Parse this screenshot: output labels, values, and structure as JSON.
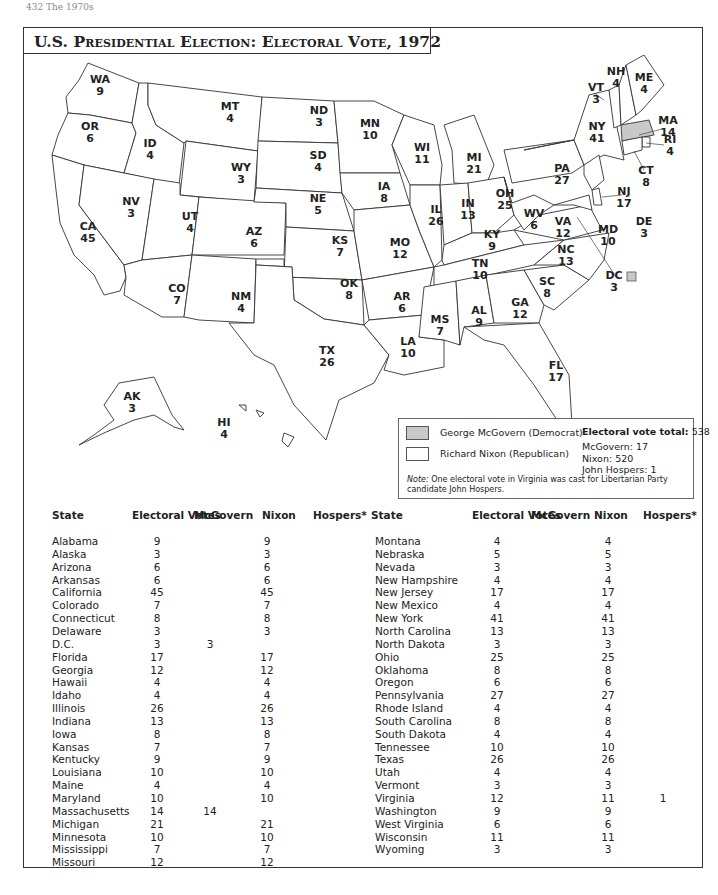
{
  "page_header": "432   The 1970s",
  "title": "U.S. Presidential Election: Electoral Vote, 1972",
  "legend": {
    "mcgovern_label": "George McGovern (Democrat)",
    "nixon_label": "Richard Nixon (Republican)",
    "mcgovern_color": "#c8c8c8",
    "nixon_color": "#ffffff",
    "total_label": "Electoral vote total:",
    "total_value": "538",
    "totals": [
      "McGovern: 17",
      "Nixon: 520",
      "John Hospers: 1"
    ],
    "note_label": "Note:",
    "note_text": " One electoral vote in Virginia was cast for Libertarian Party candidate John Hospers."
  },
  "map": {
    "labels": [
      {
        "abbr": "WA",
        "ev": "9"
      },
      {
        "abbr": "OR",
        "ev": "6"
      },
      {
        "abbr": "CA",
        "ev": "45"
      },
      {
        "abbr": "ID",
        "ev": "4"
      },
      {
        "abbr": "NV",
        "ev": "3"
      },
      {
        "abbr": "MT",
        "ev": "4"
      },
      {
        "abbr": "WY",
        "ev": "3"
      },
      {
        "abbr": "UT",
        "ev": "4"
      },
      {
        "abbr": "AZ",
        "ev": "6"
      },
      {
        "abbr": "CO",
        "ev": "7"
      },
      {
        "abbr": "NM",
        "ev": "4"
      },
      {
        "abbr": "ND",
        "ev": "3"
      },
      {
        "abbr": "SD",
        "ev": "4"
      },
      {
        "abbr": "NE",
        "ev": "5"
      },
      {
        "abbr": "KS",
        "ev": "7"
      },
      {
        "abbr": "OK",
        "ev": "8"
      },
      {
        "abbr": "TX",
        "ev": "26"
      },
      {
        "abbr": "MN",
        "ev": "10"
      },
      {
        "abbr": "IA",
        "ev": "8"
      },
      {
        "abbr": "MO",
        "ev": "12"
      },
      {
        "abbr": "AR",
        "ev": "6"
      },
      {
        "abbr": "LA",
        "ev": "10"
      },
      {
        "abbr": "WI",
        "ev": "11"
      },
      {
        "abbr": "IL",
        "ev": "26"
      },
      {
        "abbr": "MI",
        "ev": "21"
      },
      {
        "abbr": "IN",
        "ev": "13"
      },
      {
        "abbr": "OH",
        "ev": "25"
      },
      {
        "abbr": "KY",
        "ev": "9"
      },
      {
        "abbr": "TN",
        "ev": "10"
      },
      {
        "abbr": "MS",
        "ev": "7"
      },
      {
        "abbr": "AL",
        "ev": "9"
      },
      {
        "abbr": "GA",
        "ev": "12"
      },
      {
        "abbr": "FL",
        "ev": "17"
      },
      {
        "abbr": "SC",
        "ev": "8"
      },
      {
        "abbr": "NC",
        "ev": "13"
      },
      {
        "abbr": "VA",
        "ev": "12"
      },
      {
        "abbr": "WV",
        "ev": "6"
      },
      {
        "abbr": "PA",
        "ev": "27"
      },
      {
        "abbr": "NY",
        "ev": "41"
      },
      {
        "abbr": "VT",
        "ev": "3"
      },
      {
        "abbr": "NH",
        "ev": "4"
      },
      {
        "abbr": "ME",
        "ev": "4"
      },
      {
        "abbr": "MA",
        "ev": "14"
      },
      {
        "abbr": "RI",
        "ev": "4"
      },
      {
        "abbr": "CT",
        "ev": "8"
      },
      {
        "abbr": "NJ",
        "ev": "17"
      },
      {
        "abbr": "DE",
        "ev": "3"
      },
      {
        "abbr": "MD",
        "ev": "10"
      },
      {
        "abbr": "DC",
        "ev": "3"
      },
      {
        "abbr": "AK",
        "ev": "3"
      },
      {
        "abbr": "HI",
        "ev": "4"
      }
    ]
  },
  "table": {
    "headers": [
      "State",
      "Electoral Votes",
      "McGovern",
      "Nixon",
      "Hospers*"
    ],
    "left_rows": [
      [
        "Alabama",
        "9",
        "",
        "9",
        ""
      ],
      [
        "Alaska",
        "3",
        "",
        "3",
        ""
      ],
      [
        "Arizona",
        "6",
        "",
        "6",
        ""
      ],
      [
        "Arkansas",
        "6",
        "",
        "6",
        ""
      ],
      [
        "California",
        "45",
        "",
        "45",
        ""
      ],
      [
        "Colorado",
        "7",
        "",
        "7",
        ""
      ],
      [
        "Connecticut",
        "8",
        "",
        "8",
        ""
      ],
      [
        "Delaware",
        "3",
        "",
        "3",
        ""
      ],
      [
        "D.C.",
        "3",
        "3",
        "",
        ""
      ],
      [
        "Florida",
        "17",
        "",
        "17",
        ""
      ],
      [
        "Georgia",
        "12",
        "",
        "12",
        ""
      ],
      [
        "Hawaii",
        "4",
        "",
        "4",
        ""
      ],
      [
        "Idaho",
        "4",
        "",
        "4",
        ""
      ],
      [
        "Illinois",
        "26",
        "",
        "26",
        ""
      ],
      [
        "Indiana",
        "13",
        "",
        "13",
        ""
      ],
      [
        "Iowa",
        "8",
        "",
        "8",
        ""
      ],
      [
        "Kansas",
        "7",
        "",
        "7",
        ""
      ],
      [
        "Kentucky",
        "9",
        "",
        "9",
        ""
      ],
      [
        "Louisiana",
        "10",
        "",
        "10",
        ""
      ],
      [
        "Maine",
        "4",
        "",
        "4",
        ""
      ],
      [
        "Maryland",
        "10",
        "",
        "10",
        ""
      ],
      [
        "Massachusetts",
        "14",
        "14",
        "",
        ""
      ],
      [
        "Michigan",
        "21",
        "",
        "21",
        ""
      ],
      [
        "Minnesota",
        "10",
        "",
        "10",
        ""
      ],
      [
        "Mississippi",
        "7",
        "",
        "7",
        ""
      ],
      [
        "Missouri",
        "12",
        "",
        "12",
        ""
      ]
    ],
    "right_rows": [
      [
        "Montana",
        "4",
        "",
        "4",
        ""
      ],
      [
        "Nebraska",
        "5",
        "",
        "5",
        ""
      ],
      [
        "Nevada",
        "3",
        "",
        "3",
        ""
      ],
      [
        "New Hampshire",
        "4",
        "",
        "4",
        ""
      ],
      [
        "New Jersey",
        "17",
        "",
        "17",
        ""
      ],
      [
        "New Mexico",
        "4",
        "",
        "4",
        ""
      ],
      [
        "New York",
        "41",
        "",
        "41",
        ""
      ],
      [
        "North Carolina",
        "13",
        "",
        "13",
        ""
      ],
      [
        "North Dakota",
        "3",
        "",
        "3",
        ""
      ],
      [
        "Ohio",
        "25",
        "",
        "25",
        ""
      ],
      [
        "Oklahoma",
        "8",
        "",
        "8",
        ""
      ],
      [
        "Oregon",
        "6",
        "",
        "6",
        ""
      ],
      [
        "Pennsylvania",
        "27",
        "",
        "27",
        ""
      ],
      [
        "Rhode Island",
        "4",
        "",
        "4",
        ""
      ],
      [
        "South Carolina",
        "8",
        "",
        "8",
        ""
      ],
      [
        "South Dakota",
        "4",
        "",
        "4",
        ""
      ],
      [
        "Tennessee",
        "10",
        "",
        "10",
        ""
      ],
      [
        "Texas",
        "26",
        "",
        "26",
        ""
      ],
      [
        "Utah",
        "4",
        "",
        "4",
        ""
      ],
      [
        "Vermont",
        "3",
        "",
        "3",
        ""
      ],
      [
        "Virginia",
        "12",
        "",
        "11",
        "1"
      ],
      [
        "Washington",
        "9",
        "",
        "9",
        ""
      ],
      [
        "West Virginia",
        "6",
        "",
        "6",
        ""
      ],
      [
        "Wisconsin",
        "11",
        "",
        "11",
        ""
      ],
      [
        "Wyoming",
        "3",
        "",
        "3",
        ""
      ]
    ]
  },
  "chart_data": {
    "type": "table",
    "title": "U.S. Presidential Election: Electoral Vote, 1972",
    "columns": [
      "State",
      "Electoral Votes",
      "McGovern",
      "Nixon",
      "Hospers*"
    ],
    "series": [
      {
        "name": "McGovern (Democrat)",
        "total": 17,
        "states_won": [
          "Massachusetts",
          "D.C."
        ]
      },
      {
        "name": "Nixon (Republican)",
        "total": 520
      },
      {
        "name": "John Hospers (Libertarian)",
        "total": 1,
        "note": "One electoral vote in Virginia"
      }
    ],
    "total_electoral_votes": 538,
    "categories": [
      "Alabama",
      "Alaska",
      "Arizona",
      "Arkansas",
      "California",
      "Colorado",
      "Connecticut",
      "Delaware",
      "D.C.",
      "Florida",
      "Georgia",
      "Hawaii",
      "Idaho",
      "Illinois",
      "Indiana",
      "Iowa",
      "Kansas",
      "Kentucky",
      "Louisiana",
      "Maine",
      "Maryland",
      "Massachusetts",
      "Michigan",
      "Minnesota",
      "Mississippi",
      "Missouri",
      "Montana",
      "Nebraska",
      "Nevada",
      "New Hampshire",
      "New Jersey",
      "New Mexico",
      "New York",
      "North Carolina",
      "North Dakota",
      "Ohio",
      "Oklahoma",
      "Oregon",
      "Pennsylvania",
      "Rhode Island",
      "South Carolina",
      "South Dakota",
      "Tennessee",
      "Texas",
      "Utah",
      "Vermont",
      "Virginia",
      "Washington",
      "West Virginia",
      "Wisconsin",
      "Wyoming"
    ],
    "electoral_votes": [
      9,
      3,
      6,
      6,
      45,
      7,
      8,
      3,
      3,
      17,
      12,
      4,
      4,
      26,
      13,
      8,
      7,
      9,
      10,
      4,
      10,
      14,
      21,
      10,
      7,
      12,
      4,
      5,
      3,
      4,
      17,
      4,
      41,
      13,
      3,
      25,
      8,
      6,
      27,
      4,
      8,
      4,
      10,
      26,
      4,
      3,
      12,
      9,
      6,
      11,
      3
    ],
    "mcgovern": [
      0,
      0,
      0,
      0,
      0,
      0,
      0,
      0,
      3,
      0,
      0,
      0,
      0,
      0,
      0,
      0,
      0,
      0,
      0,
      0,
      0,
      14,
      0,
      0,
      0,
      0,
      0,
      0,
      0,
      0,
      0,
      0,
      0,
      0,
      0,
      0,
      0,
      0,
      0,
      0,
      0,
      0,
      0,
      0,
      0,
      0,
      0,
      0,
      0,
      0,
      0
    ],
    "nixon": [
      9,
      3,
      6,
      6,
      45,
      7,
      8,
      3,
      0,
      17,
      12,
      4,
      4,
      26,
      13,
      8,
      7,
      9,
      10,
      4,
      10,
      0,
      21,
      10,
      7,
      12,
      4,
      5,
      3,
      4,
      17,
      4,
      41,
      13,
      3,
      25,
      8,
      6,
      27,
      4,
      8,
      4,
      10,
      26,
      4,
      3,
      11,
      9,
      6,
      11,
      3
    ],
    "hospers": [
      0,
      0,
      0,
      0,
      0,
      0,
      0,
      0,
      0,
      0,
      0,
      0,
      0,
      0,
      0,
      0,
      0,
      0,
      0,
      0,
      0,
      0,
      0,
      0,
      0,
      0,
      0,
      0,
      0,
      0,
      0,
      0,
      0,
      0,
      0,
      0,
      0,
      0,
      0,
      0,
      0,
      0,
      0,
      0,
      0,
      0,
      1,
      0,
      0,
      0,
      0
    ]
  }
}
